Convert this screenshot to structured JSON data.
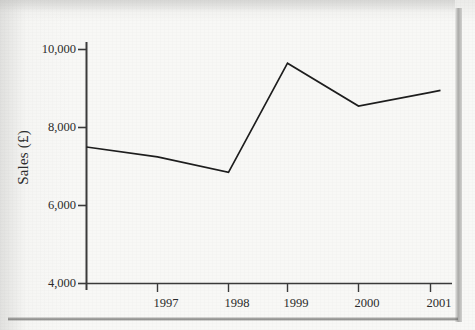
{
  "chart_data": {
    "type": "line",
    "title": "",
    "xlabel": "",
    "ylabel": "Sales (£)",
    "x": [
      "1997",
      "1998",
      "1999",
      "2000",
      "2001"
    ],
    "categories": [
      "1997",
      "1998",
      "1999",
      "2000",
      "2001"
    ],
    "values": [
      7250,
      6850,
      9650,
      8550,
      8900
    ],
    "series": [
      {
        "name": "Sales",
        "values": [
          7250,
          6850,
          9650,
          8550,
          8900
        ]
      }
    ],
    "origin_point": {
      "note": "line begins at the y-axis left of the 1997 tick",
      "value": 7500
    },
    "ylim": [
      4000,
      10600
    ],
    "yticks": [
      4000,
      6000,
      8000,
      10000
    ],
    "ytick_labels": [
      "4,000",
      "6,000",
      "8,000",
      "10,000"
    ],
    "xtick_labels": [
      "1997",
      "1998",
      "1999",
      "2000",
      "2001"
    ],
    "grid": false,
    "legend": false,
    "legend_position": "none",
    "line_color": "#1d1d1d",
    "axis_color": "#3a3a3a",
    "background_color": "#f8f8f6"
  },
  "axes": {
    "y_title": "Sales (£)",
    "y_ticks": [
      {
        "label": "10,000",
        "value": 10000
      },
      {
        "label": "8,000",
        "value": 8000
      },
      {
        "label": "6,000",
        "value": 6000
      },
      {
        "label": "4,000",
        "value": 4000
      }
    ],
    "x_ticks": [
      {
        "label": "1997",
        "value": 1997
      },
      {
        "label": "1998",
        "value": 1998
      },
      {
        "label": "1999",
        "value": 1999
      },
      {
        "label": "2000",
        "value": 2000
      },
      {
        "label": "2001",
        "value": 2001
      }
    ]
  }
}
